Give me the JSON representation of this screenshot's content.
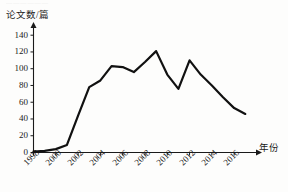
{
  "figure": {
    "ghost_text": "▁▁▁▁▁▁",
    "axis_color": "#1a1a1a",
    "line_color": "#111111"
  },
  "chart_data": {
    "type": "line",
    "title": "",
    "subtitle": "",
    "xlabel": "年份",
    "ylabel": "论文数/篇",
    "x": [
      1998,
      1999,
      2000,
      2001,
      2002,
      2003,
      2004,
      2005,
      2006,
      2007,
      2008,
      2009,
      2010,
      2011,
      2012,
      2013,
      2014,
      2015,
      2016,
      2017
    ],
    "values": [
      1,
      2,
      4,
      9,
      44,
      78,
      86,
      103,
      102,
      96,
      108,
      121,
      93,
      76,
      110,
      93,
      80,
      66,
      53,
      46
    ],
    "x_tick_labels": [
      "1998",
      "2000",
      "2002",
      "2004",
      "2006",
      "2008",
      "2010",
      "2012",
      "2014",
      "2016"
    ],
    "x_tick_values": [
      1998,
      2000,
      2002,
      2004,
      2006,
      2008,
      2010,
      2012,
      2014,
      2016
    ],
    "y_tick_labels": [
      "0",
      "20",
      "40",
      "60",
      "80",
      "100",
      "120",
      "140"
    ],
    "y_tick_values": [
      0,
      20,
      40,
      60,
      80,
      100,
      120,
      140
    ],
    "xlim": [
      1998,
      2017.6
    ],
    "ylim": [
      0,
      145
    ],
    "grid": false,
    "legend": null,
    "legend_position": "none",
    "annotations": [],
    "axis_arrow_x": true,
    "axis_arrow_y": true
  }
}
